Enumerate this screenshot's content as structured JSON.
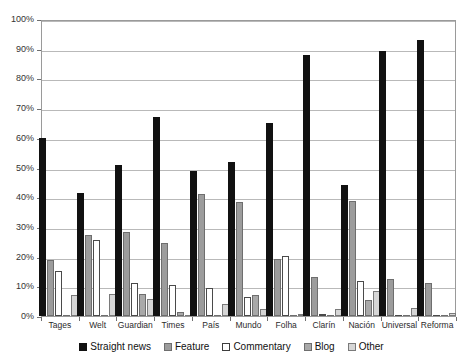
{
  "chart_data": {
    "type": "bar",
    "title": "",
    "subtitle": "",
    "xlabel": "",
    "ylabel": "",
    "ylim": [
      0,
      100
    ],
    "grid": true,
    "legend_position": "bottom",
    "ytick_labels": [
      "0%",
      "10%",
      "20%",
      "30%",
      "40%",
      "50%",
      "60%",
      "70%",
      "80%",
      "90%",
      "100%"
    ],
    "ytick_values": [
      0,
      10,
      20,
      30,
      40,
      50,
      60,
      70,
      80,
      90,
      100
    ],
    "categories": [
      "Tages",
      "Welt",
      "Guardian",
      "Times",
      "País",
      "Mundo",
      "Folha",
      "Clarín",
      "Nación",
      "Universal",
      "Reforma"
    ],
    "series": [
      {
        "name": "Straight news",
        "color": "#111111",
        "values": [
          60.0,
          41.3,
          51.0,
          67.0,
          48.7,
          52.0,
          65.0,
          88.0,
          44.0,
          89.3,
          93.0
        ]
      },
      {
        "name": "Feature",
        "color": "#9c9c9c",
        "values": [
          19.0,
          27.3,
          28.2,
          24.5,
          41.0,
          38.5,
          19.3,
          13.3,
          38.8,
          12.3,
          11.0
        ]
      },
      {
        "name": "Commentary",
        "color": "#ffffff",
        "values": [
          15.3,
          25.6,
          11.0,
          10.5,
          9.3,
          6.5,
          20.3,
          0.6,
          11.8,
          0.0,
          0.0
        ]
      },
      {
        "name": "Blog",
        "color": "#a9a9a9",
        "values": [
          0.0,
          0.0,
          7.4,
          1.2,
          0.0,
          7.0,
          0.0,
          0.0,
          5.5,
          0.0,
          0.0
        ]
      },
      {
        "name": "Other",
        "color": "#d6d6d6",
        "values": [
          7.0,
          7.4,
          5.8,
          0.0,
          4.0,
          2.5,
          0.5,
          2.5,
          8.5,
          2.7,
          1.0
        ]
      }
    ]
  }
}
